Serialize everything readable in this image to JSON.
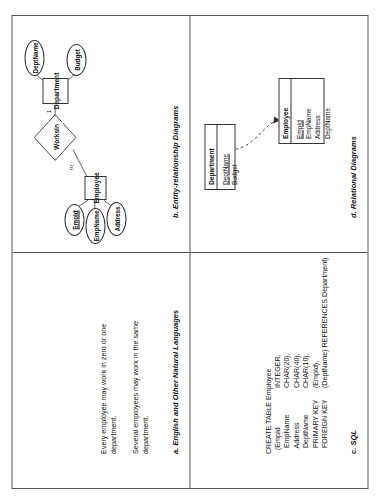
{
  "figure": {
    "panels": {
      "a": {
        "caption": "a. English and Other Natural Languages",
        "paragraph1": "Every employee may work in zero or one department.",
        "paragraph2": "Several employees may work in the same department."
      },
      "b": {
        "caption": "b. Entity-relationship Diagrams",
        "entities": [
          {
            "name": "Employee",
            "attributes": [
              {
                "label": "EmpId",
                "key": true
              },
              {
                "label": "EmpName",
                "key": false
              },
              {
                "label": "Address",
                "key": false
              }
            ]
          },
          {
            "name": "Department",
            "attributes": [
              {
                "label": "DeptName",
                "key": true
              },
              {
                "label": "Budget",
                "key": false
              }
            ]
          }
        ],
        "relationship": {
          "name": "WorksIn"
        },
        "cardinality_employee_side": "m",
        "cardinality_department_side": "1"
      },
      "c": {
        "caption": "c. SQL",
        "lines": [
          {
            "left": "CREATE TABLE Employee",
            "right": ""
          },
          {
            "left": "  (EmpId",
            "right": "INTEGER,"
          },
          {
            "left": "   EmpName",
            "right": "CHAR(20),"
          },
          {
            "left": "   Address",
            "right": "CHAR(40),"
          },
          {
            "left": "   DeptName",
            "right": "CHAR(10),"
          },
          {
            "left": "   PRIMARY KEY",
            "right": "(EmpId),"
          },
          {
            "left": "   FOREIGN KEY",
            "right": "(DeptName) REFERENCES Department)"
          }
        ]
      },
      "d": {
        "caption": "d. Relational Diagrams",
        "relations": [
          {
            "name": "Employee",
            "attributes": [
              {
                "label": "EmpId",
                "key": true
              },
              {
                "label": "EmpName",
                "key": false
              },
              {
                "label": "Address",
                "key": false
              },
              {
                "label": "DeptName",
                "key": false
              }
            ]
          },
          {
            "name": "Department",
            "attributes": [
              {
                "label": "DeptName",
                "key": true
              },
              {
                "label": "Budget",
                "key": false
              }
            ]
          }
        ],
        "foreign_key_arrow": "dashed-curved-arrow"
      }
    }
  },
  "colors": {
    "page_background": "#ffffff",
    "border": "#555555",
    "shape_stroke": "#333333",
    "text": "#111111"
  }
}
